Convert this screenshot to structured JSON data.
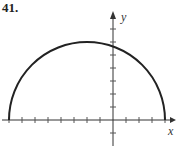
{
  "problem_number": "41.",
  "chart_data": {
    "type": "line",
    "title": "",
    "xlabel": "x",
    "ylabel": "y",
    "curve": {
      "center": [
        -2,
        0
      ],
      "radius": 6,
      "half": "upper"
    },
    "x_ticks": [
      -8,
      -7,
      -6,
      -5,
      -4,
      -3,
      -2,
      -1,
      1,
      2,
      3,
      4
    ],
    "y_ticks": [
      -1,
      1,
      2,
      3,
      4,
      5,
      6,
      7
    ],
    "xlim": [
      -8.3,
      5
    ],
    "ylim": [
      -1.6,
      8.2
    ],
    "grid": false
  }
}
